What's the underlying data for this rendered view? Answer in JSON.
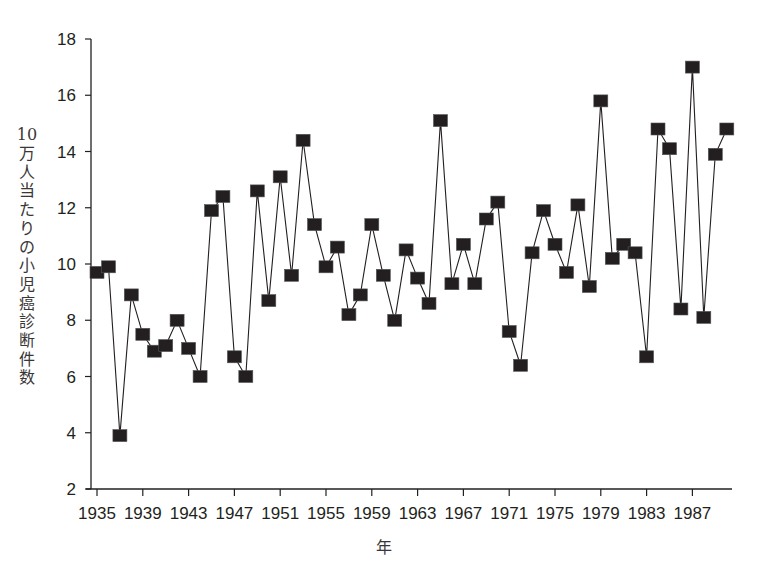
{
  "chart_data": {
    "type": "line",
    "title": "",
    "xlabel": "年",
    "ylabel": "10万人当たりの小児癌診断件数",
    "ylim": [
      2,
      18
    ],
    "yticks": [
      2,
      4,
      6,
      8,
      10,
      12,
      14,
      16,
      18
    ],
    "xlim": [
      1935,
      1990
    ],
    "xticks": [
      1935,
      1939,
      1943,
      1947,
      1951,
      1955,
      1959,
      1963,
      1967,
      1971,
      1975,
      1979,
      1983,
      1987
    ],
    "grid": false,
    "legend": null,
    "marker": "square",
    "series": [
      {
        "name": "小児癌診断件数",
        "color": "#231f20",
        "x": [
          1935,
          1936,
          1937,
          1938,
          1939,
          1940,
          1941,
          1942,
          1943,
          1944,
          1945,
          1946,
          1947,
          1948,
          1949,
          1950,
          1951,
          1952,
          1953,
          1954,
          1955,
          1956,
          1957,
          1958,
          1959,
          1960,
          1961,
          1962,
          1963,
          1964,
          1965,
          1966,
          1967,
          1968,
          1969,
          1970,
          1971,
          1972,
          1973,
          1974,
          1975,
          1976,
          1977,
          1978,
          1979,
          1980,
          1981,
          1982,
          1983,
          1984,
          1985,
          1986,
          1987,
          1988,
          1989,
          1990
        ],
        "values": [
          9.7,
          9.9,
          3.9,
          8.9,
          7.5,
          6.9,
          7.1,
          8.0,
          7.0,
          6.0,
          11.9,
          12.4,
          6.7,
          6.0,
          12.6,
          8.7,
          13.1,
          9.6,
          14.4,
          11.4,
          9.9,
          10.6,
          8.2,
          8.9,
          11.4,
          9.6,
          8.0,
          10.5,
          9.5,
          8.6,
          15.1,
          9.3,
          10.7,
          9.3,
          11.6,
          12.2,
          7.6,
          6.4,
          10.4,
          11.9,
          10.7,
          9.7,
          12.1,
          9.2,
          15.8,
          10.2,
          10.7,
          10.4,
          6.7,
          14.8,
          14.1,
          8.4,
          17.0,
          8.1,
          13.9,
          14.8
        ]
      }
    ]
  },
  "axes": {
    "ylabel_chars": [
      "10",
      "万",
      "人",
      "当",
      "た",
      "り",
      "の",
      "小",
      "児",
      "癌",
      "診",
      "断",
      "件",
      "数"
    ]
  }
}
